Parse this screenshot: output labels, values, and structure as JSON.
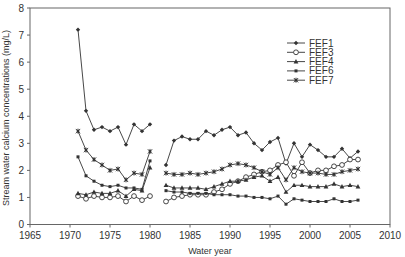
{
  "chart_data": {
    "type": "line",
    "title": "",
    "xlabel": "Water year",
    "ylabel": "Stream water calcium concentrations (mg/L)",
    "xlim": [
      1965,
      2010
    ],
    "ylim": [
      0,
      8
    ],
    "xticks": [
      1965,
      1970,
      1975,
      1980,
      1985,
      1990,
      1995,
      2000,
      2005,
      2010
    ],
    "yticks": [
      0,
      1,
      2,
      3,
      4,
      5,
      6,
      7,
      8
    ],
    "grid": false,
    "legend_position": "upper right",
    "x": [
      1971,
      1972,
      1973,
      1974,
      1975,
      1976,
      1977,
      1978,
      1979,
      1980,
      1981,
      1982,
      1983,
      1984,
      1985,
      1986,
      1987,
      1988,
      1989,
      1990,
      1991,
      1992,
      1993,
      1994,
      1995,
      1996,
      1997,
      1998,
      1999,
      2000,
      2001,
      2002,
      2003,
      2004,
      2005,
      2006
    ],
    "series": [
      {
        "name": "FEF1",
        "marker": "diamond",
        "values": [
          7.2,
          4.2,
          3.5,
          3.6,
          3.45,
          3.6,
          2.95,
          3.7,
          3.45,
          3.7,
          null,
          2.2,
          3.1,
          3.25,
          3.15,
          3.15,
          3.45,
          3.3,
          3.5,
          3.6,
          3.3,
          3.4,
          3.0,
          2.75,
          3.05,
          3.2,
          2.25,
          3.0,
          2.5,
          2.95,
          2.75,
          2.5,
          2.5,
          2.8,
          2.45,
          2.7
        ]
      },
      {
        "name": "FEF3",
        "marker": "open-circle",
        "values": [
          1.05,
          0.95,
          1.05,
          1.0,
          1.0,
          1.05,
          0.85,
          1.05,
          0.9,
          1.05,
          null,
          0.85,
          1.0,
          1.05,
          1.1,
          1.1,
          1.1,
          1.2,
          1.3,
          1.5,
          1.6,
          1.75,
          1.85,
          1.95,
          2.0,
          2.2,
          2.3,
          1.8,
          2.3,
          1.9,
          2.0,
          2.0,
          2.15,
          2.2,
          2.4,
          2.4
        ]
      },
      {
        "name": "FEF4",
        "marker": "triangle",
        "values": [
          1.15,
          1.1,
          1.2,
          1.15,
          1.15,
          1.25,
          1.05,
          1.3,
          1.25,
          2.1,
          null,
          1.45,
          1.35,
          1.35,
          1.35,
          1.35,
          1.3,
          1.4,
          1.5,
          1.6,
          1.6,
          1.65,
          1.75,
          1.8,
          1.6,
          1.75,
          1.2,
          1.45,
          1.45,
          1.4,
          1.4,
          1.4,
          1.5,
          1.4,
          1.45,
          1.4
        ]
      },
      {
        "name": "FEF6",
        "marker": "dot",
        "values": [
          2.5,
          1.8,
          1.6,
          1.45,
          1.4,
          1.45,
          1.35,
          1.35,
          1.3,
          2.35,
          null,
          1.25,
          1.2,
          1.2,
          1.15,
          1.15,
          1.15,
          1.1,
          1.1,
          1.1,
          1.05,
          1.05,
          1.0,
          1.0,
          0.95,
          1.05,
          0.75,
          0.95,
          0.9,
          0.85,
          0.85,
          0.85,
          0.95,
          0.85,
          0.85,
          0.9
        ]
      },
      {
        "name": "FEF7",
        "marker": "asterisk",
        "values": [
          3.45,
          2.75,
          2.4,
          2.2,
          2.0,
          2.05,
          1.65,
          1.9,
          1.85,
          2.7,
          null,
          1.9,
          1.85,
          1.85,
          1.9,
          1.85,
          1.9,
          1.95,
          2.05,
          2.2,
          2.25,
          2.2,
          2.1,
          1.95,
          1.85,
          2.1,
          1.65,
          2.1,
          1.95,
          1.9,
          1.9,
          1.85,
          1.85,
          1.95,
          2.0,
          2.05
        ]
      }
    ]
  },
  "colors": {
    "line": "#333333",
    "axis": "#555555",
    "background": "#ffffff"
  }
}
